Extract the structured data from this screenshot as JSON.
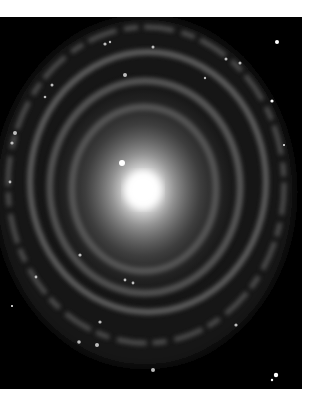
{
  "image": {
    "subject": "spiral galaxy",
    "alt": "Spiral galaxy with a bright central bulge and tightly wound ring-like spiral arms against a black starfield",
    "background_color": "#000000",
    "frame_color": "#ffffff",
    "core": {
      "x": 143,
      "y": 173,
      "color": "#ffffff"
    },
    "foreground_star": {
      "x": 122,
      "y": 146
    }
  }
}
